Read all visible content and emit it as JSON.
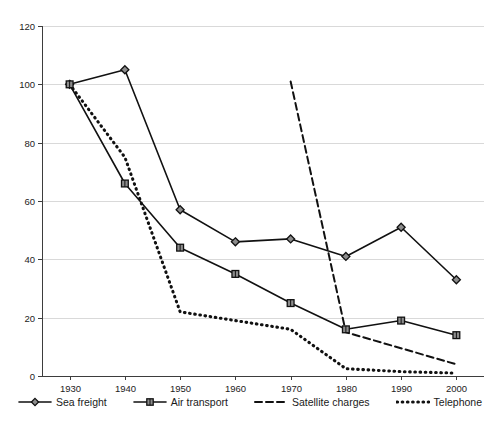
{
  "chart_data": {
    "type": "line",
    "title": "",
    "subtitle": "",
    "xlabel": "",
    "ylabel": "",
    "x": [
      1930,
      1940,
      1950,
      1960,
      1970,
      1980,
      1990,
      2000
    ],
    "xticklabels": [
      "1930",
      "1940",
      "1950",
      "1960",
      "1970",
      "1980",
      "1990",
      "2000"
    ],
    "yticks": [
      0,
      20,
      40,
      60,
      80,
      100,
      120
    ],
    "yticklabels": [
      "0",
      "20",
      "40",
      "60",
      "80",
      "100",
      "120"
    ],
    "xlim": [
      1925,
      2005
    ],
    "ylim": [
      0,
      120
    ],
    "grid": "horizontal",
    "legend_position": "bottom",
    "series": [
      {
        "name": "Sea freight",
        "marker": "diamond",
        "linestyle": "solid",
        "color": "#111111",
        "x": [
          1930,
          1940,
          1950,
          1960,
          1970,
          1980,
          1990,
          2000
        ],
        "values": [
          100,
          105,
          57,
          46,
          47,
          41,
          51,
          33
        ]
      },
      {
        "name": "Air transport",
        "marker": "square",
        "linestyle": "solid",
        "color": "#111111",
        "x": [
          1930,
          1940,
          1950,
          1960,
          1970,
          1980,
          1990,
          2000
        ],
        "values": [
          100,
          66,
          44,
          35,
          25,
          16,
          19,
          14
        ]
      },
      {
        "name": "Satellite charges",
        "marker": "none",
        "linestyle": "dashed",
        "color": "#111111",
        "x": [
          1970,
          1980,
          2000
        ],
        "values": [
          101,
          15,
          4
        ]
      },
      {
        "name": "Telephone",
        "marker": "none",
        "linestyle": "dotted",
        "color": "#111111",
        "x": [
          1930,
          1940,
          1950,
          1960,
          1970,
          1980,
          1990,
          2000
        ],
        "values": [
          100,
          75,
          22,
          19,
          16,
          2.5,
          1.5,
          1
        ]
      }
    ]
  },
  "axis": {
    "y_labels": [
      "120",
      "100",
      "80",
      "60",
      "40",
      "20",
      "0"
    ],
    "x_labels": [
      "1930",
      "1940",
      "1950",
      "1960",
      "1970",
      "1980",
      "1990",
      "2000"
    ]
  },
  "legend": {
    "items": [
      {
        "label": "Sea freight",
        "marker": "diamond",
        "linestyle": "solid"
      },
      {
        "label": "Air transport",
        "marker": "square",
        "linestyle": "solid"
      },
      {
        "label": "Satellite charges",
        "marker": "none",
        "linestyle": "dashed"
      },
      {
        "label": "Telephone",
        "marker": "none",
        "linestyle": "dotted"
      }
    ]
  },
  "colors": {
    "line": "#111111",
    "marker_fill": "#8c8c8c",
    "grid": "#d9d9d9",
    "axis": "#3d3d3d",
    "background": "#ffffff"
  }
}
